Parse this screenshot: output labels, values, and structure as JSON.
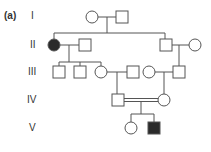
{
  "figure": {
    "panel_label": "(a)",
    "generations": [
      "I",
      "II",
      "III",
      "IV",
      "V"
    ],
    "legend": {
      "affected_color": "#2a2a2a",
      "unaffected_color": "#ffffff",
      "line_color": "#555555"
    },
    "individuals": [
      {
        "gen": "I",
        "sex": "female",
        "affected": false
      },
      {
        "gen": "I",
        "sex": "male",
        "affected": false
      },
      {
        "gen": "II",
        "sex": "female",
        "affected": true
      },
      {
        "gen": "II",
        "sex": "male",
        "affected": false
      },
      {
        "gen": "II",
        "sex": "male",
        "affected": false
      },
      {
        "gen": "II",
        "sex": "female",
        "affected": false
      },
      {
        "gen": "III",
        "sex": "male",
        "affected": false
      },
      {
        "gen": "III",
        "sex": "male",
        "affected": false
      },
      {
        "gen": "III",
        "sex": "female",
        "affected": false
      },
      {
        "gen": "III",
        "sex": "male",
        "affected": false
      },
      {
        "gen": "III",
        "sex": "female",
        "affected": false
      },
      {
        "gen": "III",
        "sex": "male",
        "affected": false
      },
      {
        "gen": "IV",
        "sex": "male",
        "affected": false
      },
      {
        "gen": "IV",
        "sex": "female",
        "affected": false,
        "note": "consanguineous marriage"
      },
      {
        "gen": "V",
        "sex": "female",
        "affected": false
      },
      {
        "gen": "V",
        "sex": "male",
        "affected": true
      }
    ]
  }
}
